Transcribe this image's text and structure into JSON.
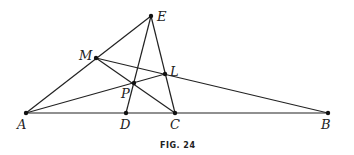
{
  "figure": {
    "caption": "FIG. 24",
    "points": {
      "A": {
        "label": "A",
        "x": 26,
        "y": 113
      },
      "D": {
        "label": "D",
        "x": 126,
        "y": 113
      },
      "C": {
        "label": "C",
        "x": 175,
        "y": 113
      },
      "B": {
        "label": "B",
        "x": 328,
        "y": 113
      },
      "E": {
        "label": "E",
        "x": 151,
        "y": 16
      },
      "M": {
        "label": "M",
        "x": 96,
        "y": 58
      },
      "L": {
        "label": "L",
        "x": 165,
        "y": 74
      },
      "P": {
        "label": "P",
        "x": 134,
        "y": 83
      }
    },
    "segments": [
      "AE",
      "AB",
      "ED",
      "EC",
      "MB",
      "MC",
      "AL"
    ]
  }
}
